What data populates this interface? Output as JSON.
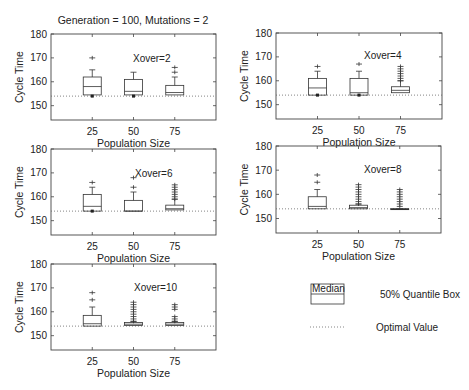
{
  "chart_data": {
    "type": "boxplot",
    "title": "Generation = 100,  Mutations = 2",
    "xlabel": "Population Size",
    "ylabel": "Cycle Time",
    "xlim": [
      0,
      100
    ],
    "ylim": [
      144,
      180
    ],
    "xticks": [
      25,
      50,
      75
    ],
    "yticks": [
      150,
      160,
      170,
      180
    ],
    "optimal_value": 154,
    "grid": false,
    "panels": [
      {
        "annotation": "Xover=2",
        "boxes": [
          {
            "x": 25,
            "q1": 154.5,
            "median": 158,
            "q3": 162,
            "whisker_low": 154,
            "whisker_high": 165,
            "outliers": [
              170
            ],
            "min_marker": 154
          },
          {
            "x": 50,
            "q1": 154.5,
            "median": 156,
            "q3": 161,
            "whisker_low": 154,
            "whisker_high": 164,
            "outliers": [],
            "min_marker": 154
          },
          {
            "x": 75,
            "q1": 154.5,
            "median": 155.5,
            "q3": 158.5,
            "whisker_low": 154.5,
            "whisker_high": 162,
            "outliers": [
              164,
              166
            ],
            "min_marker": null
          }
        ]
      },
      {
        "annotation": "Xover=4",
        "boxes": [
          {
            "x": 25,
            "q1": 154,
            "median": 157,
            "q3": 161,
            "whisker_low": 154,
            "whisker_high": 164,
            "outliers": [
              166
            ],
            "min_marker": 154
          },
          {
            "x": 50,
            "q1": 154,
            "median": 155,
            "q3": 161,
            "whisker_low": 154,
            "whisker_high": 164,
            "outliers": [
              167
            ],
            "min_marker": 154
          },
          {
            "x": 75,
            "q1": 155,
            "median": 156,
            "q3": 157.5,
            "whisker_low": 154.5,
            "whisker_high": 160,
            "outliers": [
              160,
              161,
              162,
              163,
              164,
              165,
              166
            ],
            "min_marker": null
          }
        ]
      },
      {
        "annotation": "Xover=6",
        "boxes": [
          {
            "x": 25,
            "q1": 154,
            "median": 156,
            "q3": 161,
            "whisker_low": 154,
            "whisker_high": 164,
            "outliers": [
              166
            ],
            "min_marker": 154
          },
          {
            "x": 50,
            "q1": 154,
            "median": 154,
            "q3": 158.5,
            "whisker_low": 154,
            "whisker_high": 162,
            "outliers": [
              164,
              168
            ],
            "min_marker": null
          },
          {
            "x": 75,
            "q1": 154.5,
            "median": 155,
            "q3": 156.5,
            "whisker_low": 154.5,
            "whisker_high": 159,
            "outliers": [
              159,
              160,
              161,
              162,
              163,
              164,
              165
            ],
            "min_marker": null
          }
        ]
      },
      {
        "annotation": "Xover=8",
        "boxes": [
          {
            "x": 25,
            "q1": 154,
            "median": 155,
            "q3": 159,
            "whisker_low": 154,
            "whisker_high": 162,
            "outliers": [
              165,
              168
            ],
            "min_marker": null
          },
          {
            "x": 50,
            "q1": 154,
            "median": 154.5,
            "q3": 155.5,
            "whisker_low": 154,
            "whisker_high": 156,
            "outliers": [
              156,
              157,
              158,
              159,
              160,
              161,
              162,
              163,
              164
            ],
            "min_marker": null
          },
          {
            "x": 75,
            "q1": 154,
            "median": 154,
            "q3": 154,
            "whisker_low": 154,
            "whisker_high": 154,
            "outliers": [
              155,
              156,
              157,
              158,
              159,
              160,
              161,
              162
            ],
            "min_marker": null
          }
        ]
      },
      {
        "annotation": "Xover=10",
        "boxes": [
          {
            "x": 25,
            "q1": 154,
            "median": 155,
            "q3": 158.5,
            "whisker_low": 154,
            "whisker_high": 162,
            "outliers": [
              165,
              168
            ],
            "min_marker": null
          },
          {
            "x": 50,
            "q1": 154.3,
            "median": 154.8,
            "q3": 155.5,
            "whisker_low": 154.3,
            "whisker_high": 156,
            "outliers": [
              156,
              157,
              158,
              159,
              160,
              161,
              162,
              163,
              164
            ],
            "min_marker": null
          },
          {
            "x": 75,
            "q1": 154.3,
            "median": 154.8,
            "q3": 155.5,
            "whisker_low": 154.3,
            "whisker_high": 156,
            "outliers": [
              156,
              157,
              158,
              161,
              162,
              163
            ],
            "min_marker": null
          }
        ]
      }
    ],
    "legend": {
      "box_label": "Median",
      "box_description": "50% Quantile Box",
      "line_description": "Optimal Value",
      "placement": "bottom-right"
    }
  }
}
